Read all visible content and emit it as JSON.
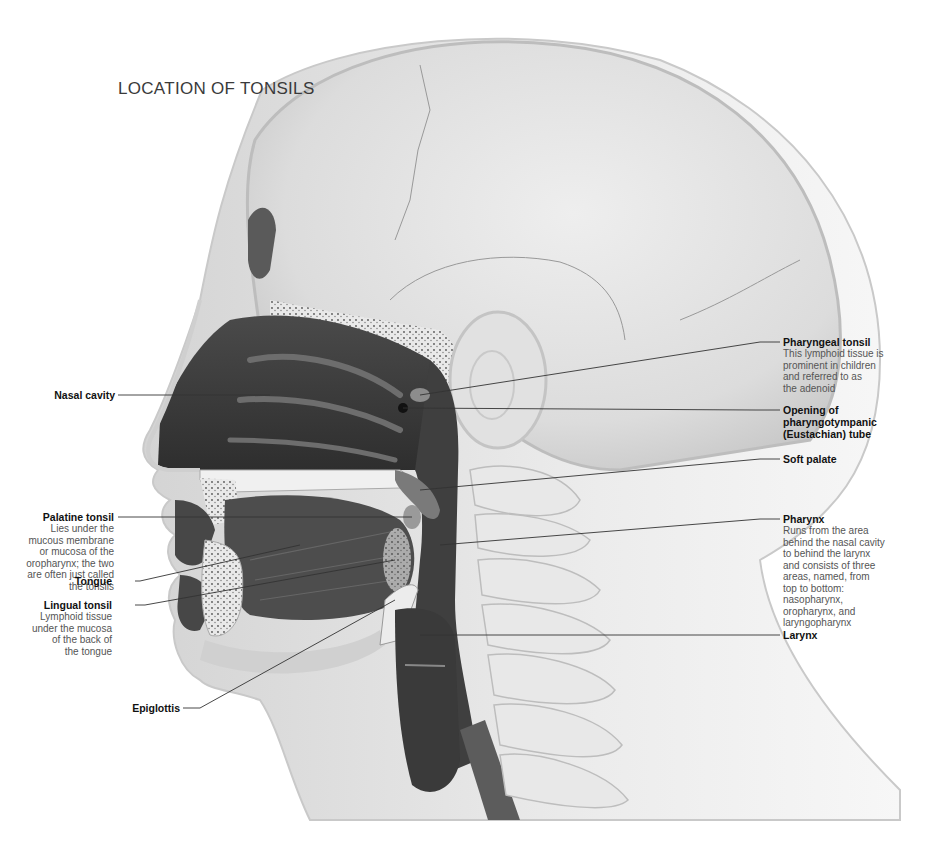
{
  "figure": {
    "title": "LOCATION OF TONSILS",
    "colors": {
      "background": "#ffffff",
      "skin": "#e6e6e6",
      "skull": "#dadada",
      "cavity_dark": "#3c3c3c",
      "tissue_mid": "#6a6a6a",
      "bone_light": "#efefef",
      "label_heading": "#111111",
      "label_body": "#555555",
      "leader_line": "#333333"
    }
  },
  "labels_left": [
    {
      "id": "nasal-cavity",
      "heading": "Nasal cavity",
      "description": ""
    },
    {
      "id": "palatine-tonsil",
      "heading": "Palatine tonsil",
      "description_lines": [
        "Lies under the",
        "mucous membrane",
        "or mucosa of the",
        "oropharynx; the two",
        "are often just called",
        "the tonsils"
      ]
    },
    {
      "id": "tongue",
      "heading": "Tongue",
      "description": ""
    },
    {
      "id": "lingual-tonsil",
      "heading": "Lingual tonsil",
      "description_lines": [
        "Lymphoid tissue",
        "under the mucosa",
        "of the back of",
        "the tongue"
      ]
    },
    {
      "id": "epiglottis",
      "heading": "Epiglottis",
      "description": ""
    }
  ],
  "labels_right": [
    {
      "id": "pharyngeal-tonsil",
      "heading": "Pharyngeal tonsil",
      "description_lines": [
        "This lymphoid tissue is",
        "prominent in children",
        "and referred to as",
        "the adenoid"
      ]
    },
    {
      "id": "eustachian-opening",
      "heading_lines": [
        "Opening of",
        "pharyngotympanic",
        "(Eustachian) tube"
      ]
    },
    {
      "id": "soft-palate",
      "heading": "Soft palate"
    },
    {
      "id": "pharynx",
      "heading": "Pharynx",
      "description_lines": [
        "Runs from the area",
        "behind the nasal cavity",
        "to behind the larynx",
        "and consists of three",
        "areas, named, from",
        "top to bottom:",
        "nasopharynx,",
        "oropharynx, and",
        "laryngopharynx"
      ]
    },
    {
      "id": "larynx",
      "heading": "Larynx"
    }
  ]
}
